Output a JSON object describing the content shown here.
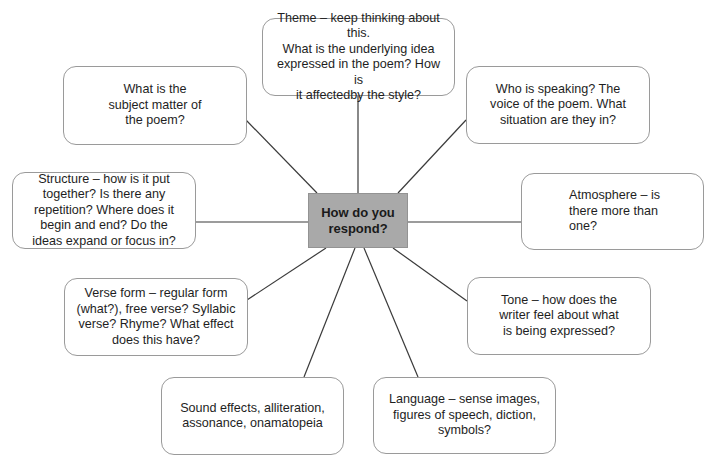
{
  "diagram": {
    "type": "spider-diagram",
    "center": {
      "label": "How do you\nrespond?",
      "fill": "#a9a9a9"
    },
    "nodes": {
      "theme": "Theme – keep thinking about this.\nWhat is the underlying idea\nexpressed in the poem? How is\nit affectedby the style?",
      "subject": "What is the\nsubject matter of\nthe poem?",
      "speaker": "Who is speaking? The\nvoice of the poem. What\nsituation are they in?",
      "structure": "Structure – how is it put\ntogether? Is there any\nrepetition? Where does it\nbegin and end? Do the\nideas expand or focus in?",
      "atmosphere": "Atmosphere – is\nthere more than\none?",
      "verse_form": "Verse form – regular form\n(what?), free verse?  Syllabic\nverse? Rhyme? What effect\ndoes this have?",
      "tone": "Tone – how does the\nwriter feel about what\nis being expressed?",
      "sound": "Sound effects, alliteration,\nassonance, onamatopeia",
      "language": "Language – sense images,\nfigures of speech, diction,\nsymbols?"
    },
    "colors": {
      "line": "#3a3a3a",
      "node_border": "#9a9a9a",
      "center_border": "#939393"
    }
  }
}
